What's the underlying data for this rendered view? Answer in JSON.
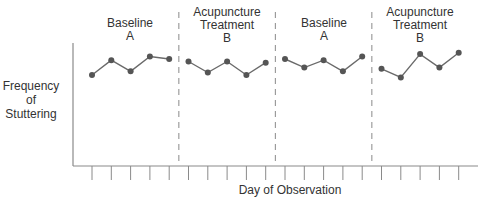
{
  "chart_data": {
    "type": "line",
    "title": "",
    "xlabel": "Day of Observation",
    "ylabel": "Frequency of Stuttering",
    "ylabel_lines": [
      "Frequency",
      "of",
      "Stuttering"
    ],
    "ylim": [
      0,
      10
    ],
    "y_ticks": [],
    "grid": false,
    "legend": null,
    "x": [
      1,
      2,
      3,
      4,
      5,
      6,
      7,
      8,
      9,
      10,
      11,
      12,
      13,
      14,
      15,
      16,
      17,
      18,
      19,
      20
    ],
    "phases": [
      {
        "name": "Baseline",
        "code": "A",
        "title_lines": [
          "Baseline",
          "A"
        ],
        "days": [
          1,
          2,
          3,
          4,
          5
        ],
        "values": [
          7.4,
          8.6,
          7.7,
          8.9,
          8.7
        ]
      },
      {
        "name": "Acupuncture Treatment",
        "code": "B",
        "title_lines": [
          "Acupuncture",
          "Treatment",
          "B"
        ],
        "days": [
          6,
          7,
          8,
          9,
          10
        ],
        "values": [
          8.5,
          7.6,
          8.5,
          7.4,
          8.4
        ]
      },
      {
        "name": "Baseline",
        "code": "A",
        "title_lines": [
          "Baseline",
          "A"
        ],
        "days": [
          11,
          12,
          13,
          14,
          15
        ],
        "values": [
          8.7,
          8.0,
          8.6,
          7.7,
          8.9
        ]
      },
      {
        "name": "Acupuncture Treatment",
        "code": "B",
        "title_lines": [
          "Acupuncture",
          "Treatment",
          "B"
        ],
        "days": [
          16,
          17,
          18,
          19,
          20
        ],
        "values": [
          7.9,
          7.2,
          9.1,
          8.0,
          9.2
        ]
      }
    ],
    "phase_change_lines_after_day": [
      5,
      10,
      15
    ],
    "annotations": [
      "Baseline A",
      "Acupuncture Treatment B",
      "Baseline A",
      "Acupuncture Treatment B"
    ]
  },
  "colors": {
    "axis": "#8a8a8a",
    "line": "#6a6a6a",
    "marker": "#555555",
    "divider": "#8a8a8a",
    "text": "#333333"
  },
  "labels": {
    "ylabel_line1": "Frequency",
    "ylabel_line2": "of",
    "ylabel_line3": "Stuttering",
    "xlabel": "Day of Observation",
    "phase1_line1": "Baseline",
    "phase1_line2": "A",
    "phase2_line1": "Acupuncture",
    "phase2_line2": "Treatment",
    "phase2_line3": "B",
    "phase3_line1": "Baseline",
    "phase3_line2": "A",
    "phase4_line1": "Acupuncture",
    "phase4_line2": "Treatment",
    "phase4_line3": "B"
  }
}
